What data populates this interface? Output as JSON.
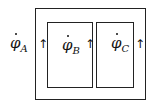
{
  "diagram": {
    "flows": [
      {
        "symbol": "φ",
        "subscript": "A",
        "arrow": "↑"
      },
      {
        "symbol": "φ",
        "subscript": "B",
        "arrow": "↑"
      },
      {
        "symbol": "φ",
        "subscript": "C",
        "arrow": "↑"
      }
    ]
  }
}
